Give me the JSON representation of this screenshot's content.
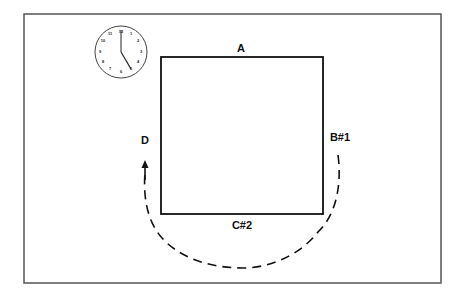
{
  "diagram": {
    "clock": {
      "numerals": [
        "12",
        "1",
        "2",
        "3",
        "4",
        "5",
        "6",
        "7",
        "8",
        "9",
        "10",
        "11"
      ],
      "time": "5:00"
    },
    "labels": {
      "top": "A",
      "right": "B#1",
      "bottom": "C#2",
      "left": "D"
    },
    "path": {
      "style": "dashed",
      "direction": "counterclockwise from right side around bottom to left side",
      "arrow": "up"
    },
    "colors": {
      "ink": "#111111",
      "border": "#555555",
      "background": "#ffffff"
    }
  }
}
